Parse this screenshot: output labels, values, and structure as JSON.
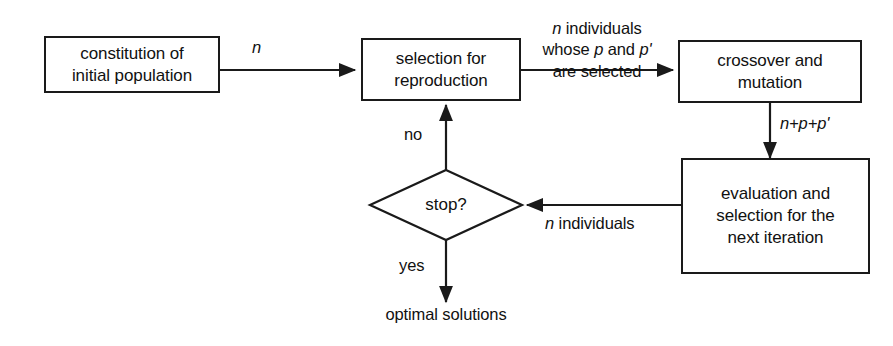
{
  "diagram": {
    "stroke_color": "#1a1a1a",
    "text_color": "#111111",
    "background_color": "#ffffff"
  },
  "nodes": {
    "constitution": {
      "line1": "constitution of",
      "line2": "initial population"
    },
    "selection": {
      "line1": "selection for",
      "line2": "reproduction"
    },
    "crossover": {
      "line1": "crossover and",
      "line2": "mutation"
    },
    "evaluation": {
      "line1": "evaluation and",
      "line2": "selection for the",
      "line3": "next iteration"
    },
    "decision": {
      "text": "stop?"
    },
    "terminal": {
      "text": "optimal solutions"
    }
  },
  "edge_labels": {
    "n_count": "n",
    "selected_line1_italic": "n",
    "selected_line1_rest": " individuals",
    "selected_line2_pre": "whose ",
    "selected_line2_p": "p",
    "selected_line2_mid": " and ",
    "selected_line2_pprime": "p'",
    "selected_line3": "are selected",
    "offspring_count": "n+p+p'",
    "feedback_italic": "n",
    "feedback_rest": " individuals",
    "branch_no": "no",
    "branch_yes": "yes"
  }
}
